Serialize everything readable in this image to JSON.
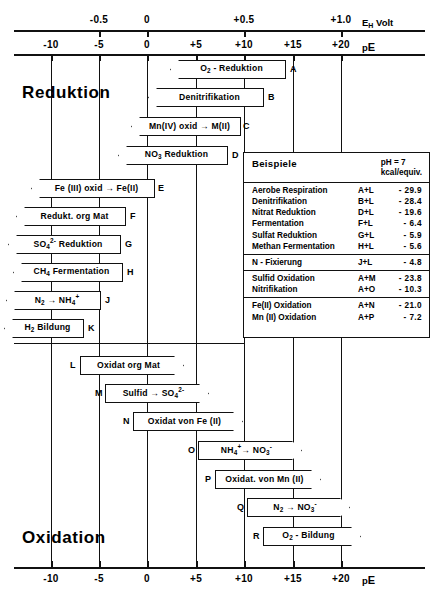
{
  "axes": {
    "top": {
      "unit_label": "EH Volt",
      "unit_main": "E",
      "unit_sub": "H",
      "unit_tail": " Volt",
      "ticks": [
        {
          "label": "-0.5",
          "x": 99
        },
        {
          "label": "0",
          "x": 147
        },
        {
          "label": "+0.5",
          "x": 244
        },
        {
          "label": "+1.0",
          "x": 341
        }
      ]
    },
    "bottom_top_row": {
      "unit_main": "p",
      "unit_tail": "E",
      "ticks": [
        {
          "label": "-10",
          "x": 51
        },
        {
          "label": "-5",
          "x": 99
        },
        {
          "label": "0",
          "x": 147
        },
        {
          "label": "+5",
          "x": 196
        },
        {
          "label": "+10",
          "x": 244
        },
        {
          "label": "+15",
          "x": 293
        },
        {
          "label": "+20",
          "x": 341
        }
      ]
    },
    "bottom": {
      "unit_main": "p",
      "unit_tail": "E",
      "ticks": [
        {
          "label": "-10",
          "x": 51
        },
        {
          "label": "-5",
          "x": 99
        },
        {
          "label": "0",
          "x": 147
        },
        {
          "label": "+5",
          "x": 196
        },
        {
          "label": "+10",
          "x": 244
        },
        {
          "label": "+15",
          "x": 293
        },
        {
          "label": "+20",
          "x": 341
        }
      ]
    }
  },
  "captions": {
    "reduction": "Reduktion",
    "oxidation": "Oxidation"
  },
  "reduction_boxes": [
    {
      "id": "A",
      "html": "O<sub>2</sub> - Reduktion",
      "left": 170,
      "width": 116,
      "top": 60,
      "label_x": 290
    },
    {
      "id": "B",
      "html": "Denitrifikation",
      "left": 148,
      "width": 116,
      "top": 88,
      "label_x": 268
    },
    {
      "id": "C",
      "html": "Mn(IV) oxid &#8594; M(II)",
      "left": 131,
      "width": 110,
      "top": 117,
      "label_x": 243
    },
    {
      "id": "D",
      "html": "NO<sub>3</sub> Reduktion",
      "left": 118,
      "width": 110,
      "top": 146,
      "label_x": 232
    },
    {
      "id": "E",
      "html": "Fe (III) oxid &#8594; Fe(II)",
      "left": 31,
      "width": 124,
      "top": 179,
      "label_x": 158
    },
    {
      "id": "F",
      "html": "Redukt. org Mat",
      "left": 16,
      "width": 110,
      "top": 207,
      "label_x": 130
    },
    {
      "id": "G",
      "html": "SO<sub>4</sub><sup>2-</sup> Reduktion",
      "left": 8,
      "width": 113,
      "top": 235,
      "label_x": 125
    },
    {
      "id": "H",
      "html": "CH<sub>4</sub> Fermentation",
      "left": 13,
      "width": 110,
      "top": 263,
      "label_x": 127
    },
    {
      "id": "J",
      "html": "N<sub>2</sub> &#8594; NH<sub>4</sub><sup>+</sup>",
      "left": 6,
      "width": 95,
      "top": 291,
      "label_x": 105
    },
    {
      "id": "K",
      "html": "H<sub>2</sub> Bildung",
      "left": 4,
      "width": 80,
      "top": 319,
      "label_x": 88
    }
  ],
  "oxidation_boxes": [
    {
      "id": "L",
      "html": "Oxidat org Mat",
      "left": 80,
      "width": 104,
      "top": 356,
      "label_x": 70
    },
    {
      "id": "M",
      "html": "Sulfid &#8594; SO<sub>4</sub><sup>2-</sup>",
      "left": 105,
      "width": 104,
      "top": 384,
      "label_x": 95
    },
    {
      "id": "N",
      "html": "Oxidat von Fe (II)",
      "left": 133,
      "width": 110,
      "top": 412,
      "label_x": 123
    },
    {
      "id": "O",
      "html": "NH<sub>4</sub><sup>+</sup>&#8594; NO<sub>3</sub><sup>-</sup>",
      "left": 198,
      "width": 104,
      "top": 441,
      "label_x": 188
    },
    {
      "id": "P",
      "html": "Oxidat. von Mn (II)",
      "left": 215,
      "width": 106,
      "top": 470,
      "label_x": 205
    },
    {
      "id": "Q",
      "html": "N<sub>2</sub> &#8594; NO<sub>3</sub><sup>-</sup>",
      "left": 247,
      "width": 103,
      "top": 498,
      "label_x": 237
    },
    {
      "id": "R",
      "html": "O<sub>2</sub> - Bildung",
      "left": 263,
      "width": 98,
      "top": 527,
      "label_x": 253
    }
  ],
  "legend": {
    "title": "Beispiele",
    "units_line1": "pH = 7",
    "units_line2": "kcal/equiv.",
    "groups": [
      {
        "rows": [
          {
            "name": "Aerobe  Respiration",
            "code": "A+L",
            "value": "- 29.9"
          },
          {
            "name": "Denitrifikation",
            "code": "B+L",
            "value": "- 28.4"
          },
          {
            "name": "Nitrat   Reduktion",
            "code": "D+L",
            "value": "- 19.6"
          },
          {
            "name": "Fermentation",
            "code": "F+L",
            "value": "-  6.4"
          },
          {
            "name": "Sulfat   Reduktion",
            "code": "G+L",
            "value": "-  5.9"
          },
          {
            "name": "Methan  Fermentation",
            "code": "H+L",
            "value": "-  5.6"
          }
        ]
      },
      {
        "rows": [
          {
            "name": "N - Fixierung",
            "code": "J+L",
            "value": "-  4.8"
          }
        ]
      },
      {
        "rows": [
          {
            "name": "Sulfid Oxidation",
            "code": "A+M",
            "value": "- 23.8"
          },
          {
            "name": "Nitrifikation",
            "code": "A+O",
            "value": "- 10.3"
          }
        ]
      },
      {
        "rows": [
          {
            "name": "Fe(II) Oxidation",
            "code": "A+N",
            "value": "- 21.0"
          },
          {
            "name": "Mn (II) Oxidation",
            "code": "A+P",
            "value": "-  7.2"
          }
        ]
      }
    ]
  }
}
